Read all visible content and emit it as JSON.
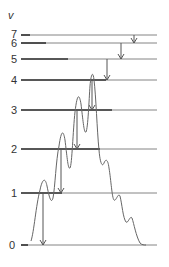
{
  "diagram": {
    "axis_label": "v",
    "colors": {
      "line": "#555555",
      "thick_line": "#333333",
      "arrow": "#555555",
      "curve": "#666666",
      "text": "#333333"
    },
    "levels": [
      {
        "label": "0",
        "y": 245,
        "thick_end": 28
      },
      {
        "label": "1",
        "y": 193,
        "thick_end": 62
      },
      {
        "label": "2",
        "y": 149,
        "thick_end": 100
      },
      {
        "label": "3",
        "y": 110,
        "thick_end": 112
      },
      {
        "label": "4",
        "y": 80,
        "thick_end": 106
      },
      {
        "label": "5",
        "y": 59,
        "thick_end": 68
      },
      {
        "label": "6",
        "y": 43,
        "thick_end": 46
      },
      {
        "label": "7",
        "y": 35,
        "thick_end": 30
      }
    ],
    "transitions": [
      {
        "from": "1",
        "to": "0",
        "x": 43
      },
      {
        "from": "2",
        "to": "1",
        "x": 61
      },
      {
        "from": "3",
        "to": "2",
        "x": 77
      },
      {
        "from": "4",
        "to": "3",
        "x": 92
      },
      {
        "from": "5",
        "to": "4",
        "x": 107
      },
      {
        "from": "6",
        "to": "5",
        "x": 121
      },
      {
        "from": "7",
        "to": "6",
        "x": 134
      }
    ]
  }
}
